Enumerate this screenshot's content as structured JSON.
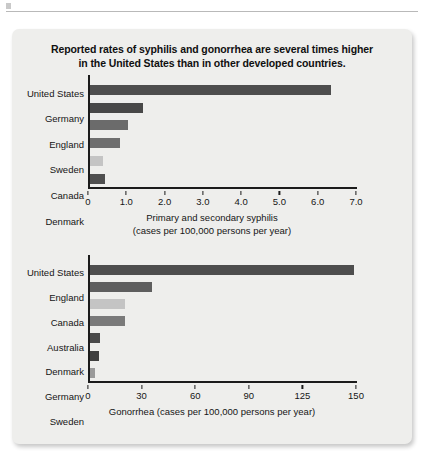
{
  "figure": {
    "title_line1": "Reported rates of syphilis and gonorrhea are several times higher",
    "title_line2": "in the United States than in other developed countries."
  },
  "chart_data": [
    {
      "type": "bar",
      "orientation": "horizontal",
      "id": "syphilis",
      "title": "",
      "xlabel_line1": "Primary and secondary syphilis",
      "xlabel_line2": "(cases per 100,000 persons per year)",
      "ylabel": "",
      "xlim": [
        0,
        7.0
      ],
      "grid": false,
      "legend": "none",
      "tick_labels": [
        "0",
        "1.0",
        "2.0",
        "3.0",
        "4.0",
        "5.0",
        "6.0",
        "7.0"
      ],
      "tick_values": [
        0,
        1.0,
        2.0,
        3.0,
        4.0,
        5.0,
        6.0,
        7.0
      ],
      "categories": [
        "United States",
        "Germany",
        "England",
        "Sweden",
        "Canada",
        "Denmark"
      ],
      "values": [
        6.3,
        1.4,
        1.0,
        0.8,
        0.35,
        0.4
      ],
      "bar_colors": [
        "#4d4d4d",
        "#484848",
        "#6b6b6b",
        "#6e6e6e",
        "#c4c4c4",
        "#4f4f4f"
      ]
    },
    {
      "type": "bar",
      "orientation": "horizontal",
      "id": "gonorrhea",
      "title": "",
      "xlabel_line1": "Gonorrhea (cases per 100,000 persons per year)",
      "xlabel_line2": "",
      "ylabel": "",
      "xlim": [
        0,
        150
      ],
      "grid": false,
      "legend": "none",
      "tick_labels": [
        "0",
        "30",
        "60",
        "90",
        "125",
        "150"
      ],
      "tick_values": [
        0,
        30,
        60,
        90,
        120,
        150
      ],
      "categories": [
        "United States",
        "England",
        "Canada",
        "Australia",
        "Denmark",
        "Germany",
        "Sweden"
      ],
      "values": [
        148,
        35,
        20,
        20,
        6,
        5,
        3
      ],
      "bar_colors": [
        "#4d4d4d",
        "#5e5e5e",
        "#c4c4c4",
        "#7a7a7a",
        "#4a4a4a",
        "#3f3f3f",
        "#9a9a9a"
      ]
    }
  ]
}
